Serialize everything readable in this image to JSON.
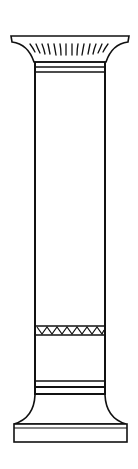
{
  "figure": {
    "parts": [
      "capital",
      "shaft",
      "zigzag-band",
      "base"
    ],
    "colors": {
      "stroke": "#111111",
      "background": "#ffffff"
    }
  }
}
